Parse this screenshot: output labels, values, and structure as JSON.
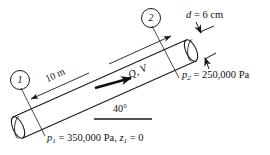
{
  "figure": {
    "background_color": "#ffffff",
    "line_color": "#1a1a1a"
  },
  "stations": [
    {
      "id": "1",
      "label": "1"
    },
    {
      "id": "2",
      "label": "2"
    }
  ],
  "labels": {
    "diameter": {
      "symbol": "d",
      "equals": "= 6 cm",
      "full": "d = 6 cm"
    },
    "length": {
      "full": "10 m",
      "value": "10",
      "unit": "m"
    },
    "flow": {
      "full": "Q, V",
      "discharge": "Q",
      "velocity": "V"
    },
    "angle": {
      "full": "40°",
      "value": "40",
      "unit": "°"
    },
    "pressure_2": {
      "symbol": "p",
      "subscript": "2",
      "equals": "= 250,000 Pa",
      "value": "250,000",
      "unit": "Pa"
    },
    "pressure_1": {
      "symbol": "p",
      "subscript": "1",
      "equals": "= 350,000 Pa,",
      "value": "350,000",
      "unit": "Pa",
      "elevation_symbol": "z",
      "elevation_subscript": "1",
      "elevation_equals": "= 0",
      "elevation_value": "0"
    }
  }
}
